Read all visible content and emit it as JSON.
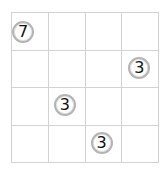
{
  "puzzle": {
    "rows": 4,
    "cols": 4,
    "cells": [
      [
        "7",
        "",
        "",
        ""
      ],
      [
        "",
        "",
        "",
        "3"
      ],
      [
        "",
        "3",
        "",
        ""
      ],
      [
        "",
        "",
        "3",
        ""
      ]
    ]
  },
  "colors": {
    "grid_line": "#d2d2d2",
    "clue_ring": "#b4b4b4",
    "clue_text": "#111111",
    "background": "#ffffff"
  }
}
